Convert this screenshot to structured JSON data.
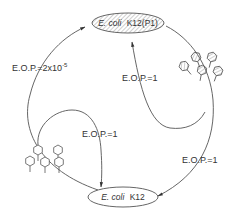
{
  "nodes": {
    "top": {
      "species": "E. coli",
      "strain": "K12(P1)",
      "hatched": true
    },
    "bottom": {
      "species": "E. coli",
      "strain": "K12",
      "hatched": false
    }
  },
  "edges": [
    {
      "id": "left-outer",
      "from": "bottom",
      "to": "top",
      "label": "E.O.P.=2x10",
      "exponent": "-5"
    },
    {
      "id": "left-inner",
      "from": "left-phages",
      "to": "bottom",
      "label": "E.O.P.=1"
    },
    {
      "id": "right-inner",
      "from": "right-phages",
      "to": "top",
      "label": "E.O.P.=1"
    },
    {
      "id": "right-outer",
      "from": "top",
      "to": "bottom",
      "label": "E.O.P.=1"
    }
  ],
  "phage_groups": [
    {
      "id": "right-phages",
      "hatched": true,
      "count": 5
    },
    {
      "id": "left-phages",
      "hatched": false,
      "count": 5
    }
  ],
  "colors": {
    "stroke": "#555555",
    "text": "#333333",
    "background": "#ffffff"
  }
}
